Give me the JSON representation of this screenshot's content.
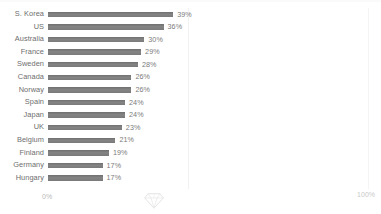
{
  "chart_data": {
    "type": "bar",
    "orientation": "horizontal",
    "title": "",
    "subtitle": "",
    "xlabel": "",
    "ylabel": "",
    "xlim": [
      0,
      100
    ],
    "grid": true,
    "legend": null,
    "categories": [
      "S. Korea",
      "US",
      "Australia",
      "France",
      "Sweden",
      "Canada",
      "Norway",
      "Spain",
      "Japan",
      "UK",
      "Belgium",
      "Finland",
      "Germany",
      "Hungary"
    ],
    "values": [
      39,
      36,
      30,
      29,
      28,
      26,
      26,
      24,
      24,
      23,
      21,
      19,
      17,
      17
    ],
    "value_labels": [
      "39%",
      "36%",
      "30%",
      "29%",
      "28%",
      "26%",
      "26%",
      "24%",
      "24%",
      "23%",
      "21%",
      "19%",
      "17%",
      "17%"
    ],
    "bars": [
      {
        "category": "S. Korea",
        "value": 39,
        "label": "39%"
      },
      {
        "category": "US",
        "value": 36,
        "label": "36%"
      },
      {
        "category": "Australia",
        "value": 30,
        "label": "30%"
      },
      {
        "category": "France",
        "value": 29,
        "label": "29%"
      },
      {
        "category": "Sweden",
        "value": 28,
        "label": "28%"
      },
      {
        "category": "Canada",
        "value": 26,
        "label": "26%"
      },
      {
        "category": "Norway",
        "value": 26,
        "label": "26%"
      },
      {
        "category": "Spain",
        "value": 24,
        "label": "24%"
      },
      {
        "category": "Japan",
        "value": 24,
        "label": "24%"
      },
      {
        "category": "UK",
        "value": 23,
        "label": "23%"
      },
      {
        "category": "Belgium",
        "value": 21,
        "label": "21%"
      },
      {
        "category": "Finland",
        "value": 19,
        "label": "19%"
      },
      {
        "category": "Germany",
        "value": 17,
        "label": "17%"
      },
      {
        "category": "Hungary",
        "value": 17,
        "label": "17%"
      }
    ],
    "axis": {
      "min_label": "0%",
      "max_label": "100%"
    },
    "colors": {
      "bar": "#808080",
      "category_label": "#6e6e6e",
      "value_label": "#7a7a7a",
      "axis_label": "#c0c0c0",
      "gridline": "#f1f1f1",
      "background": "#ffffff"
    }
  },
  "watermark": {
    "icon": "diamond-icon"
  }
}
